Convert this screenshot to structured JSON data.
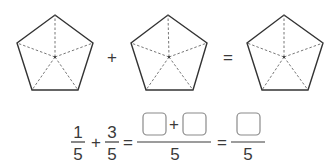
{
  "pentagons": [
    {
      "id": "left",
      "parts": 5,
      "shaded": 0
    },
    {
      "id": "middle",
      "parts": 5,
      "shaded": 0
    },
    {
      "id": "right",
      "parts": 5,
      "shaded": 0
    }
  ],
  "operators": {
    "plus": "+",
    "equals": "="
  },
  "equation": {
    "term1": {
      "numerator": "1",
      "denominator": "5"
    },
    "plus": "+",
    "term2": {
      "numerator": "3",
      "denominator": "5"
    },
    "eq1": "=",
    "combined": {
      "numerator_blank1": "",
      "numerator_plus": "+",
      "numerator_blank2": "",
      "denominator": "5"
    },
    "eq2": "=",
    "result": {
      "numerator_blank": "",
      "denominator": "5"
    }
  },
  "colors": {
    "stroke": "#333333",
    "dashed": "#555555",
    "box": "#8a8a8a",
    "text": "#3a3a3a"
  }
}
